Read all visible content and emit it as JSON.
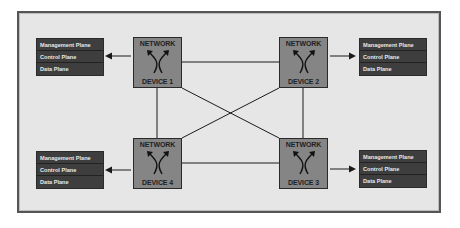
{
  "diagram": {
    "devices": [
      {
        "id": "d1",
        "top": "NETWORK",
        "bottom": "DEVICE 1"
      },
      {
        "id": "d2",
        "top": "NETWORK",
        "bottom": "DEVICE 2"
      },
      {
        "id": "d3",
        "top": "NETWORK",
        "bottom": "DEVICE 3"
      },
      {
        "id": "d4",
        "top": "NETWORK",
        "bottom": "DEVICE 4"
      }
    ],
    "plane_panels": [
      {
        "attached_to": "DEVICE 1",
        "planes": [
          "Management Plane",
          "Control Plane",
          "Data Plane"
        ]
      },
      {
        "attached_to": "DEVICE 2",
        "planes": [
          "Management Plane",
          "Control Plane",
          "Data Plane"
        ]
      },
      {
        "attached_to": "DEVICE 4",
        "planes": [
          "Management Plane",
          "Control Plane",
          "Data Plane"
        ]
      },
      {
        "attached_to": "DEVICE 3",
        "planes": [
          "Management Plane",
          "Control Plane",
          "Data Plane"
        ]
      }
    ],
    "links": [
      [
        "DEVICE 1",
        "DEVICE 2"
      ],
      [
        "DEVICE 1",
        "DEVICE 4"
      ],
      [
        "DEVICE 1",
        "DEVICE 3"
      ],
      [
        "DEVICE 2",
        "DEVICE 3"
      ],
      [
        "DEVICE 2",
        "DEVICE 4"
      ],
      [
        "DEVICE 4",
        "DEVICE 3"
      ]
    ],
    "colors": {
      "background": "#e6e6e6",
      "device_fill": "#858585",
      "panel_fill": "#3e3e3e",
      "panel_text": "#e8e8e8",
      "line": "#1a1a1a"
    }
  }
}
